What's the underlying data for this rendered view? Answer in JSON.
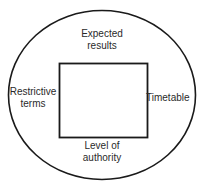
{
  "diagram": {
    "type": "venn-style-containment-diagram",
    "shapes": {
      "outer_ellipse": {
        "name": "outer-ellipse",
        "stroke_color": "#1a1a1a",
        "fill_color": "none",
        "stroke_width": 1.6,
        "cx": 102,
        "cy": 95,
        "rx": 94,
        "ry": 85
      },
      "inner_rectangle": {
        "name": "inner-rectangle",
        "stroke_color": "#1a1a1a",
        "fill_color": "#ffffff",
        "stroke_width": 1.8,
        "x": 59,
        "y": 63,
        "width": 88,
        "height": 74
      }
    },
    "labels": {
      "top": "Expected\nresults",
      "left": "Restrictive\nterms",
      "right": "Timetable",
      "bottom": "Level of\nauthority"
    },
    "text_color": "#2a2a2a",
    "background_color": "#ffffff"
  }
}
